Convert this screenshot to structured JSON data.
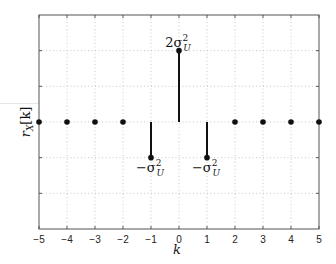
{
  "chart_data": {
    "type": "stem",
    "title": "",
    "xlabel": "k",
    "ylabel": "r_X[k]",
    "xlim": [
      -5,
      5
    ],
    "ylim_units": "sigma_U^2",
    "ylim": [
      -3,
      3
    ],
    "grid": true,
    "grid_style": "dotted",
    "x_ticks": [
      "-5",
      "-4",
      "-3",
      "-2",
      "-1",
      "0",
      "1",
      "2",
      "3",
      "4",
      "5"
    ],
    "y_ticks": [],
    "x": [
      -5,
      -4,
      -3,
      -2,
      -1,
      0,
      1,
      2,
      3,
      4,
      5
    ],
    "values": [
      0,
      0,
      0,
      0,
      -1,
      2,
      -1,
      0,
      0,
      0,
      0
    ],
    "value_units": "sigma_U^2",
    "annotations": [
      {
        "x": 0,
        "y": 2,
        "text": "2σ_U^2",
        "position": "above"
      },
      {
        "x": -1,
        "y": -1,
        "text": "-σ_U^2",
        "position": "below"
      },
      {
        "x": 1,
        "y": -1,
        "text": "-σ_U^2",
        "position": "below"
      }
    ]
  },
  "labels": {
    "xlabel": "k",
    "ylabel_main": "r",
    "ylabel_sub": "X",
    "ylabel_arg": "[k]",
    "ann_center_coef": "2σ",
    "ann_neg": "−σ",
    "ann_sup": "2",
    "ann_sub": "U"
  }
}
